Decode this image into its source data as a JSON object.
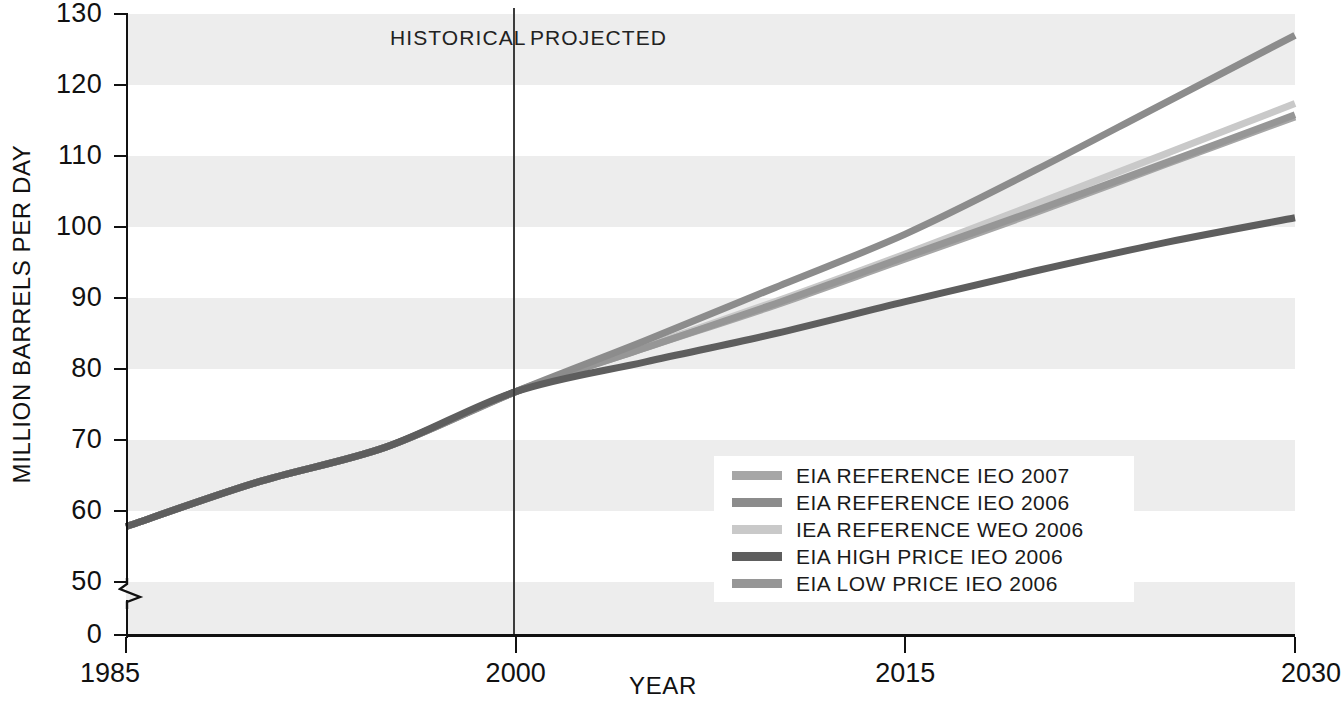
{
  "axes": {
    "y_title": "MILLION BARRELS PER DAY",
    "x_title": "YEAR",
    "y_ticks": [
      "130",
      "120",
      "110",
      "100",
      "90",
      "80",
      "70",
      "60",
      "50",
      "0"
    ],
    "x_ticks": [
      "1985",
      "2000",
      "2015",
      "2030"
    ]
  },
  "annotations": {
    "historical": "HISTORICAL",
    "projected": "PROJECTED",
    "divider_year": 2000
  },
  "legend": {
    "items": [
      {
        "label": "EIA REFERENCE IEO 2007",
        "color": "#a6a6a6"
      },
      {
        "label": "EIA REFERENCE IEO 2006",
        "color": "#8c8c8c"
      },
      {
        "label": "IEA REFERENCE WEO 2006",
        "color": "#c9c9c9"
      },
      {
        "label": "EIA HIGH PRICE IEO 2006",
        "color": "#5e5e5e"
      },
      {
        "label": "EIA LOW PRICE IEO 2006",
        "color": "#969696"
      }
    ]
  },
  "chart_data": {
    "type": "line",
    "title": "",
    "xlabel": "YEAR",
    "ylabel": "MILLION BARRELS PER DAY",
    "xlim": [
      1985,
      2030
    ],
    "ylim": [
      50,
      130
    ],
    "y_axis_break": true,
    "y_axis_break_note": "axis broken between 0 and 50",
    "grid": "alternating horizontal shaded bands every 10 units",
    "legend_position": "inside lower right",
    "x": [
      1985,
      1990,
      1995,
      2000,
      2005,
      2010,
      2015,
      2020,
      2025,
      2030
    ],
    "series": [
      {
        "name": "EIA REFERENCE IEO 2007",
        "color": "#a6a6a6",
        "values": [
          57.8,
          64.0,
          69.0,
          76.8,
          83.0,
          89.0,
          95.5,
          102.0,
          108.8,
          115.5
        ]
      },
      {
        "name": "EIA REFERENCE IEO 2006",
        "color": "#8c8c8c",
        "values": [
          57.8,
          64.0,
          69.0,
          76.8,
          84.0,
          91.5,
          99.0,
          108.0,
          117.5,
          127.0
        ]
      },
      {
        "name": "IEA REFERENCE WEO 2006",
        "color": "#c9c9c9",
        "values": [
          57.8,
          64.0,
          69.0,
          76.8,
          83.2,
          89.5,
          96.2,
          103.2,
          110.3,
          117.4
        ]
      },
      {
        "name": "EIA HIGH PRICE IEO 2006",
        "color": "#5e5e5e",
        "values": [
          57.8,
          64.0,
          69.0,
          76.8,
          81.0,
          85.0,
          89.5,
          93.8,
          97.8,
          101.3
        ]
      },
      {
        "name": "EIA LOW PRICE IEO 2006",
        "color": "#969696",
        "values": [
          57.8,
          64.0,
          69.0,
          76.8,
          83.0,
          89.2,
          95.8,
          102.3,
          109.0,
          115.8
        ]
      }
    ]
  }
}
